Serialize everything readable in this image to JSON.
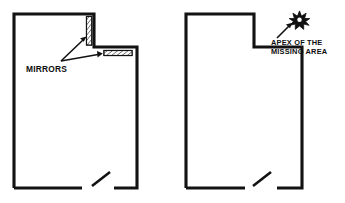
{
  "figure": {
    "background_color": "#ffffff",
    "line_color": "#121212",
    "width": 345,
    "height": 203
  },
  "diagrams": [
    {
      "id": "left-plan",
      "name": "floor-plan-with-mirrors",
      "annotation": {
        "label": "MIRRORS",
        "leader_count": 2
      },
      "features": [
        {
          "name": "vertical-mirror",
          "orientation": "vertical",
          "hatched": true
        },
        {
          "name": "horizontal-mirror",
          "orientation": "horizontal",
          "hatched": true
        },
        {
          "name": "door-opening",
          "symbol": "door-swing"
        }
      ]
    },
    {
      "id": "right-plan",
      "name": "floor-plan-with-apex-marker",
      "annotation": {
        "label_line_1": "APEX OF THE",
        "label_line_2": "MISSING AREA",
        "marker": "starburst"
      },
      "features": [
        {
          "name": "apex-marker",
          "symbol": "starburst"
        },
        {
          "name": "door-opening",
          "symbol": "door-swing"
        }
      ]
    }
  ],
  "labels": {
    "mirrors": "MIRRORS",
    "apex_line_1": "APEX OF THE",
    "apex_line_2": "MISSING AREA"
  }
}
